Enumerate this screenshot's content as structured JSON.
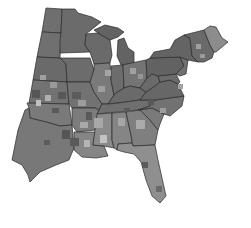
{
  "map": {
    "region": "Eastern United States",
    "style": "grayscale choropleth, county-level shading",
    "colors": {
      "background": "#ffffff",
      "base": "#6e6e6e",
      "dark": "#555555",
      "medium": "#7f7f7f",
      "light": "#a8a8a8",
      "lightest": "#c4c4c4",
      "border": "#2a2a2a"
    },
    "states": [
      {
        "id": "ND",
        "fill": "#6f6f6f"
      },
      {
        "id": "SD",
        "fill": "#707070"
      },
      {
        "id": "NE",
        "fill": "#6a6a6a"
      },
      {
        "id": "KS",
        "fill": "#727272"
      },
      {
        "id": "OK",
        "fill": "#7a7a7a"
      },
      {
        "id": "TX",
        "fill": "#787878"
      },
      {
        "id": "MN",
        "fill": "#6b6b6b"
      },
      {
        "id": "IA",
        "fill": "#6c6c6c"
      },
      {
        "id": "MO",
        "fill": "#727272"
      },
      {
        "id": "AR",
        "fill": "#7c7c7c"
      },
      {
        "id": "LA",
        "fill": "#858585"
      },
      {
        "id": "WI",
        "fill": "#6a6a6a"
      },
      {
        "id": "IL",
        "fill": "#7a7a7a"
      },
      {
        "id": "MI",
        "fill": "#636363"
      },
      {
        "id": "IN",
        "fill": "#6c6c6c"
      },
      {
        "id": "OH",
        "fill": "#747474"
      },
      {
        "id": "KY",
        "fill": "#6a6a6a"
      },
      {
        "id": "TN",
        "fill": "#6f6f6f"
      },
      {
        "id": "MS",
        "fill": "#8a8a8a"
      },
      {
        "id": "AL",
        "fill": "#858585"
      },
      {
        "id": "GA",
        "fill": "#7f7f7f"
      },
      {
        "id": "FL",
        "fill": "#8f8f8f"
      },
      {
        "id": "SC",
        "fill": "#7a7a7a"
      },
      {
        "id": "NC",
        "fill": "#727272"
      },
      {
        "id": "VA",
        "fill": "#676767"
      },
      {
        "id": "WV",
        "fill": "#6a6a6a"
      },
      {
        "id": "PA",
        "fill": "#626262"
      },
      {
        "id": "NY",
        "fill": "#646464"
      },
      {
        "id": "MD",
        "fill": "#6b6b6b"
      },
      {
        "id": "NJ",
        "fill": "#707070"
      },
      {
        "id": "NE-states",
        "fill": "#6a6a6a"
      },
      {
        "id": "ME",
        "fill": "#8c8c8c"
      }
    ]
  }
}
